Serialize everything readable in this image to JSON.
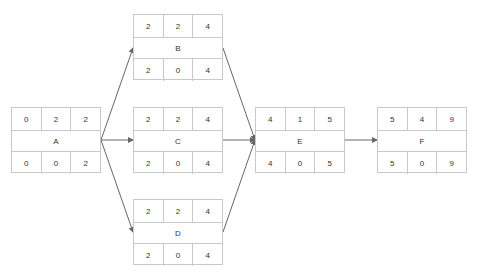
{
  "nodes": [
    {
      "id": "A",
      "name": "A",
      "top": [
        "0",
        "2",
        "2"
      ],
      "bottom": [
        "0",
        "0",
        "2"
      ]
    },
    {
      "id": "B",
      "name": "B",
      "top": [
        "2",
        "2",
        "4"
      ],
      "bottom": [
        "2",
        "0",
        "4"
      ]
    },
    {
      "id": "C",
      "name": "C",
      "top": [
        "2",
        "2",
        "4"
      ],
      "bottom": [
        "2",
        "0",
        "4"
      ]
    },
    {
      "id": "D",
      "name": "D",
      "top": [
        "2",
        "2",
        "4"
      ],
      "bottom": [
        "2",
        "0",
        "4"
      ]
    },
    {
      "id": "E",
      "name": "E",
      "top": [
        "4",
        "1",
        "5"
      ],
      "bottom": [
        "4",
        "0",
        "5"
      ]
    },
    {
      "id": "F",
      "name": "F",
      "top": [
        "5",
        "4",
        "9"
      ],
      "bottom": [
        "5",
        "0",
        "9"
      ]
    }
  ],
  "edges": [
    {
      "from": "A",
      "to": "B"
    },
    {
      "from": "A",
      "to": "C"
    },
    {
      "from": "A",
      "to": "D"
    },
    {
      "from": "B",
      "to": "E"
    },
    {
      "from": "C",
      "to": "E"
    },
    {
      "from": "D",
      "to": "E"
    },
    {
      "from": "E",
      "to": "F"
    }
  ],
  "colors": {
    "border": "#c8c8c8",
    "edge": "#666666",
    "text": "#333333"
  }
}
